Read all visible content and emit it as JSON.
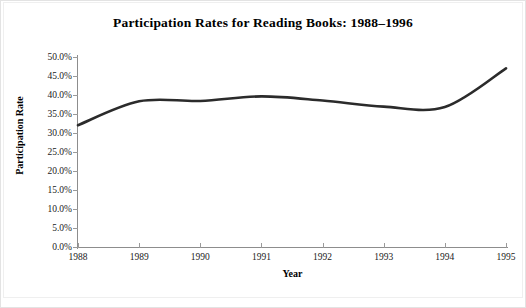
{
  "chart_data": {
    "type": "line",
    "title": "Participation Rates for Reading Books: 1988–1996",
    "xlabel": "Year",
    "ylabel": "Participation Rate",
    "x": [
      1988,
      1989,
      1990,
      1991,
      1992,
      1993,
      1994,
      1995
    ],
    "categories": [
      "1988",
      "1989",
      "1990",
      "1991",
      "1992",
      "1993",
      "1994",
      "1995"
    ],
    "values": [
      32.1,
      38.4,
      38.5,
      39.7,
      38.6,
      37.0,
      36.9,
      47.1
    ],
    "series": [
      {
        "name": "Participation Rate",
        "values": [
          32.1,
          38.4,
          38.5,
          39.7,
          38.6,
          37.0,
          36.9,
          47.1
        ],
        "color": "#2b2b2b"
      }
    ],
    "xlim": [
      1988,
      1995
    ],
    "ylim": [
      0.0,
      50.0
    ],
    "ytick_values": [
      50.0,
      45.0,
      40.0,
      35.0,
      30.0,
      25.0,
      20.0,
      15.0,
      10.0,
      5.0,
      0.0
    ],
    "ytick_labels": [
      "50.0%",
      "45.0%",
      "40.0%",
      "35.0%",
      "30.0%",
      "25.0%",
      "20.0%",
      "15.0%",
      "10.0%",
      "5.0%",
      "0.0%"
    ],
    "xtick_labels": [
      "1988",
      "1989",
      "1990",
      "1991",
      "1992",
      "1993",
      "1994",
      "1995"
    ],
    "grid": false,
    "legend": null,
    "legend_position": "none",
    "annotations": [],
    "line_style": "smooth",
    "line_width_px": 2.6
  },
  "axes": {
    "y_ticks": [
      {
        "label": "50.0%",
        "value": 50.0
      },
      {
        "label": "45.0%",
        "value": 45.0
      },
      {
        "label": "40.0%",
        "value": 40.0
      },
      {
        "label": "35.0%",
        "value": 35.0
      },
      {
        "label": "30.0%",
        "value": 30.0
      },
      {
        "label": "25.0%",
        "value": 25.0
      },
      {
        "label": "20.0%",
        "value": 20.0
      },
      {
        "label": "15.0%",
        "value": 15.0
      },
      {
        "label": "10.0%",
        "value": 10.0
      },
      {
        "label": "5.0%",
        "value": 5.0
      },
      {
        "label": "0.0%",
        "value": 0.0
      }
    ],
    "x_ticks": [
      {
        "label": "1988",
        "value": 1988
      },
      {
        "label": "1989",
        "value": 1989
      },
      {
        "label": "1990",
        "value": 1990
      },
      {
        "label": "1991",
        "value": 1991
      },
      {
        "label": "1992",
        "value": 1992
      },
      {
        "label": "1993",
        "value": 1993
      },
      {
        "label": "1994",
        "value": 1994
      },
      {
        "label": "1995",
        "value": 1995
      }
    ]
  },
  "colors": {
    "line": "#2b2b2b",
    "axis": "#8d8d8d",
    "text": "#000000",
    "background": "#ffffff"
  }
}
